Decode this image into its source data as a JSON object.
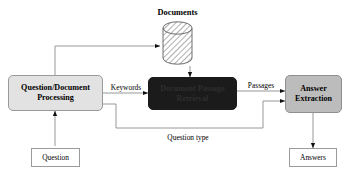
{
  "diagram": {
    "background": "#ffffff",
    "colors": {
      "process_light": "#e2e2e2",
      "process_dark": "#1b1b1b",
      "process_mid": "#bcbcbc",
      "io_fill": "#ffffff",
      "stroke": "#9a9a9a",
      "text": "#000000"
    },
    "datastore": {
      "name": "documents-datastore",
      "label": "Documents",
      "shape": "cylinder",
      "fill_pattern": "cross-hatch"
    },
    "nodes": [
      {
        "id": "question-document-processing",
        "line1": "Question/Document",
        "line2": "Processing",
        "shape": "rounded-rect",
        "fill": "#e2e2e2"
      },
      {
        "id": "document-passage-retrieval",
        "line1": "Document Passage",
        "line2": "Retrieval",
        "shape": "rounded-rect",
        "fill": "#1b1b1b"
      },
      {
        "id": "answer-extraction",
        "line1": "Answer",
        "line2": "Extraction",
        "shape": "rounded-rect",
        "fill": "#bcbcbc"
      }
    ],
    "io_nodes": [
      {
        "id": "question-input",
        "label": "Question",
        "shape": "rect"
      },
      {
        "id": "answers-output",
        "label": "Answers",
        "shape": "rect"
      }
    ],
    "edge_labels": [
      {
        "id": "keywords-label",
        "label": "Keywords"
      },
      {
        "id": "passages-label",
        "label": "Passages"
      },
      {
        "id": "question-type-label",
        "label": "Question type"
      }
    ]
  }
}
